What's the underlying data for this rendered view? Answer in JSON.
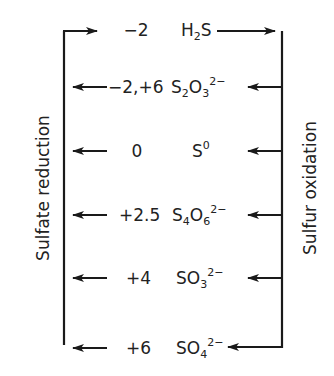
{
  "diagram": {
    "left_label": "Sulfate reduction",
    "right_label": "Sulfur oxidation",
    "line_color": "#1a1a1a",
    "rows": [
      {
        "oxidation_state": "−2",
        "species": {
          "base": "H",
          "sub1": "2",
          "mid": "S",
          "sub2": "",
          "sup": ""
        },
        "y": 30
      },
      {
        "oxidation_state": "−2,+6",
        "species": {
          "base": "S",
          "sub1": "2",
          "mid": "O",
          "sub2": "3",
          "sup": "2−"
        },
        "y": 87
      },
      {
        "oxidation_state": "0",
        "species": {
          "base": "S",
          "sub1": "",
          "mid": "",
          "sub2": "",
          "sup": "0"
        },
        "y": 151
      },
      {
        "oxidation_state": "+2.5",
        "species": {
          "base": "S",
          "sub1": "4",
          "mid": "O",
          "sub2": "6",
          "sup": "2−"
        },
        "y": 215
      },
      {
        "oxidation_state": "+4",
        "species": {
          "base": "SO",
          "sub1": "3",
          "mid": "",
          "sub2": "",
          "sup": "2−"
        },
        "y": 278
      },
      {
        "oxidation_state": "+6",
        "species": {
          "base": "SO",
          "sub1": "4",
          "mid": "",
          "sub2": "",
          "sup": "2−"
        },
        "y": 348
      }
    ]
  }
}
